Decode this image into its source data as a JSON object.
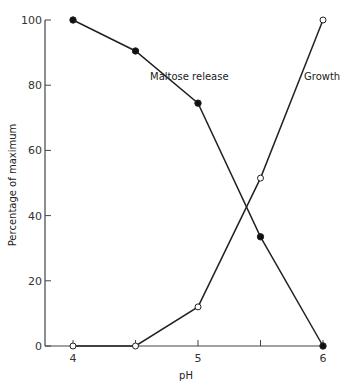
{
  "chart_data": {
    "type": "line",
    "title": "",
    "xlabel": "pH",
    "ylabel": "Percentage of maximum",
    "x": [
      4,
      4.5,
      5,
      5.5,
      6
    ],
    "xticks": [
      4,
      4.5,
      5,
      5.5,
      6
    ],
    "xtick_labels": [
      "4",
      "",
      "5",
      "",
      "6"
    ],
    "yticks": [
      0,
      20,
      40,
      60,
      80,
      100
    ],
    "ytick_labels": [
      "0",
      "20",
      "40",
      "60",
      "80",
      "100"
    ],
    "xlim": [
      3.8,
      6
    ],
    "ylim": [
      0,
      100
    ],
    "grid": false,
    "legend": "inline labels",
    "series": [
      {
        "name": "Maltose release",
        "marker": "filled-circle",
        "values": [
          100,
          90.5,
          74.5,
          33.5,
          0
        ]
      },
      {
        "name": "Growth",
        "marker": "open-circle",
        "values": [
          0,
          0,
          12,
          51.5,
          100
        ]
      }
    ]
  },
  "labels": {
    "xlabel": "pH",
    "ylabel": "Percentage of maximum",
    "maltose": "Maltose release",
    "growth": "Growth"
  }
}
